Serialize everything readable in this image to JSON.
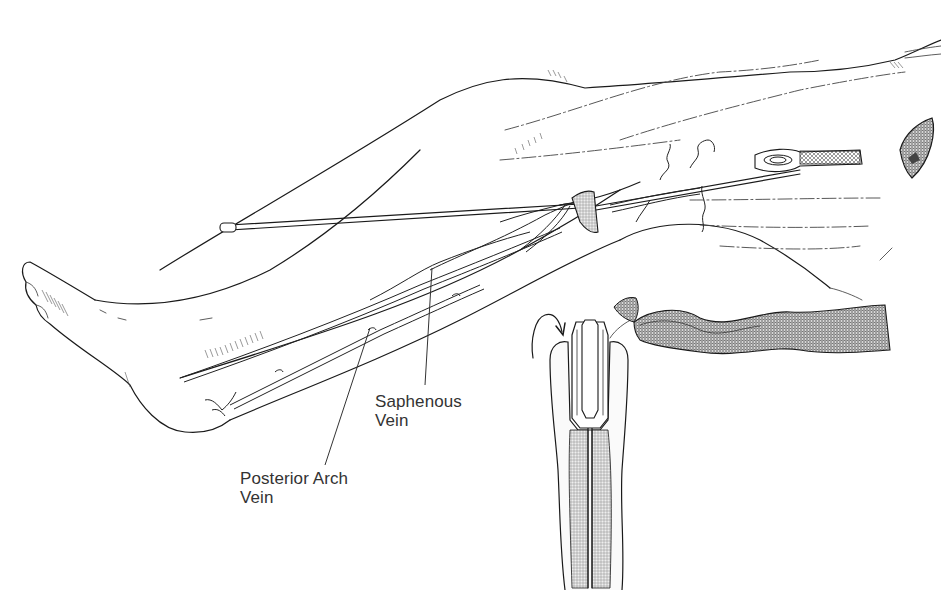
{
  "figure": {
    "labels": {
      "saphenous_vein_line1": "Saphenous",
      "saphenous_vein_line2": "Vein",
      "posterior_arch_vein_line1": "Posterior Arch",
      "posterior_arch_vein_line2": "Vein"
    },
    "panels": [
      {
        "name": "leg-view",
        "description": "Leg with vein stripper inserted from ankle to groin incision"
      },
      {
        "name": "inset-detail",
        "description": "Stripper head invaginating the vein, with rotation arrow"
      }
    ],
    "colors": {
      "background": "#ffffff",
      "ink": "#1a1a1a",
      "label_text": "#333333"
    }
  }
}
